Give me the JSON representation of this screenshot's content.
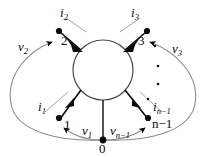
{
  "figure": {
    "type": "circuit-network-diagram",
    "colors": {
      "ink": "#0a0a0a",
      "arc": "#8c8c8c",
      "circle_stroke": "#4a4a4a",
      "background": "#ffffff"
    }
  },
  "nodes": [
    {
      "id": "n1",
      "label": "1",
      "x": 63,
      "y": 119
    },
    {
      "id": "n2",
      "label": "2",
      "x": 62,
      "y": 38
    },
    {
      "id": "n3",
      "label": "3",
      "x": 140,
      "y": 38
    },
    {
      "id": "nn1",
      "label": "n−1",
      "x": 148,
      "y": 119
    },
    {
      "id": "n0",
      "label": "0",
      "x": 103,
      "y": 140
    }
  ],
  "currents": [
    {
      "id": "i1",
      "base": "i",
      "sub": "1",
      "label": "i1"
    },
    {
      "id": "i2",
      "base": "i",
      "sub": "2",
      "label": "i2"
    },
    {
      "id": "i3",
      "base": "i",
      "sub": "3",
      "label": "i3"
    },
    {
      "id": "in1",
      "base": "i",
      "sub": "n−1",
      "label": "in-1"
    }
  ],
  "voltages": [
    {
      "id": "v1",
      "base": "v",
      "sub": "1",
      "label": "v1"
    },
    {
      "id": "v2",
      "base": "v",
      "sub": "2",
      "label": "v2"
    },
    {
      "id": "v3",
      "base": "v",
      "sub": "3",
      "label": "v3"
    },
    {
      "id": "vn1",
      "base": "v",
      "sub": "n−1",
      "label": "vn-1"
    }
  ],
  "labels": {
    "node_1": "1",
    "node_2": "2",
    "node_3": "3",
    "node_n_minus_1": "n−1",
    "node_0": "0",
    "i_base": "i",
    "v_base": "v",
    "sub_1": "1",
    "sub_2": "2",
    "sub_3": "3",
    "sub_n_minus_1": "n−1",
    "ellipsis": "·"
  },
  "ellipsis_dots": 3
}
